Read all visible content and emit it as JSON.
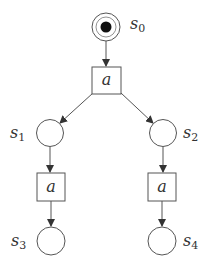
{
  "diagram": {
    "type": "petri-net",
    "colors": {
      "stroke": "#555555",
      "token": "#111111",
      "text": "#333333",
      "background": "#ffffff"
    },
    "places": [
      {
        "id": "s0",
        "label": "s",
        "sub": "0",
        "tokens": 1,
        "cx": 106,
        "cy": 27
      },
      {
        "id": "s1",
        "label": "s",
        "sub": "1",
        "tokens": 0,
        "cx": 50,
        "cy": 133
      },
      {
        "id": "s2",
        "label": "s",
        "sub": "2",
        "tokens": 0,
        "cx": 163,
        "cy": 133
      },
      {
        "id": "s3",
        "label": "s",
        "sub": "3",
        "tokens": 0,
        "cx": 51,
        "cy": 241
      },
      {
        "id": "s4",
        "label": "s",
        "sub": "4",
        "tokens": 0,
        "cx": 162,
        "cy": 241
      }
    ],
    "transitions": [
      {
        "id": "t0",
        "label": "a"
      },
      {
        "id": "t1",
        "label": "a"
      },
      {
        "id": "t2",
        "label": "a"
      }
    ],
    "arcs": [
      {
        "from": "s0",
        "to": "t0"
      },
      {
        "from": "t0",
        "to": "s1"
      },
      {
        "from": "t0",
        "to": "s2"
      },
      {
        "from": "s1",
        "to": "t1"
      },
      {
        "from": "s2",
        "to": "t2"
      },
      {
        "from": "t1",
        "to": "s3"
      },
      {
        "from": "t2",
        "to": "s4"
      }
    ]
  }
}
